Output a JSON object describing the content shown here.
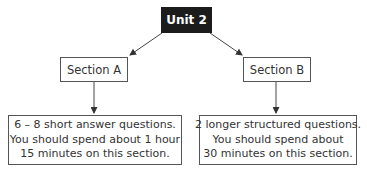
{
  "diagram": {
    "root": {
      "label": "Unit 2",
      "fill": "#1c1c1c",
      "text_color": "#ffffff"
    },
    "sections": [
      {
        "label": "Section A",
        "detail_lines": [
          "6 – 8 short answer questions.",
          "You should spend about 1 hour",
          "15 minutes on this section."
        ]
      },
      {
        "label": "Section B",
        "detail_lines": [
          "2 longer structured questions.",
          "You should spend about",
          "30 minutes on this section."
        ]
      }
    ],
    "edges": [
      {
        "from": "Unit 2",
        "to": "Section A"
      },
      {
        "from": "Unit 2",
        "to": "Section B"
      },
      {
        "from": "Section A",
        "to": "Section A detail"
      },
      {
        "from": "Section B",
        "to": "Section B detail"
      }
    ]
  }
}
